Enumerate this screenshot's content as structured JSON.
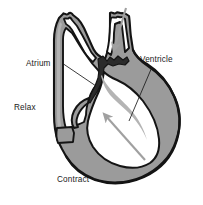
{
  "figure": {
    "background_color": "#ffffff"
  },
  "colors": {
    "muscle_wall": "#9b9b9b",
    "muscle_wall_light": "#b4b4b4",
    "chamber_interior": "#ffffff",
    "outline": "#141414",
    "valve": "#2b2b2b",
    "arrow": "#a0a0a0",
    "label_text": "#1a1a1a",
    "leader_line": "#1a1a1a"
  },
  "labels": [
    {
      "id": "atrium",
      "text": "Atrium",
      "x": 26,
      "y": 66,
      "anchor": "start",
      "leader": {
        "x1": 62,
        "y1": 63,
        "x2": 96,
        "y2": 86
      }
    },
    {
      "id": "ventricle",
      "text": "Ventricle",
      "x": 140,
      "y": 62,
      "anchor": "start",
      "leader": {
        "x1": 152,
        "y1": 67,
        "x2": 129,
        "y2": 121
      }
    },
    {
      "id": "relax",
      "text": "Relax",
      "x": 14,
      "y": 110,
      "anchor": "start",
      "leader": null
    },
    {
      "id": "contract",
      "text": "Contract",
      "x": 57,
      "y": 182,
      "anchor": "start",
      "leader": null
    }
  ],
  "arrows": [
    {
      "id": "inflow-arrow",
      "description": "blood flowing down into the heart through the great vessel",
      "direction": "down",
      "x1": 126,
      "y1": 8,
      "x2": 113,
      "y2": 53
    },
    {
      "id": "outflow-arrow",
      "description": "blood ejected from contracting ventricle upward",
      "direction": "up-left",
      "x1": 145,
      "y1": 160,
      "x2": 104,
      "y2": 113
    }
  ],
  "structures": [
    {
      "id": "left-great-vessel",
      "name": "great vessel (left)"
    },
    {
      "id": "right-great-vessel",
      "name": "great vessel (right)"
    },
    {
      "id": "atrium-chamber",
      "name": "atrium chamber"
    },
    {
      "id": "ventricle-chamber",
      "name": "ventricle chamber"
    },
    {
      "id": "valve",
      "name": "atrioventricular valve"
    },
    {
      "id": "ventricle-wall",
      "name": "ventricular muscle wall"
    }
  ]
}
